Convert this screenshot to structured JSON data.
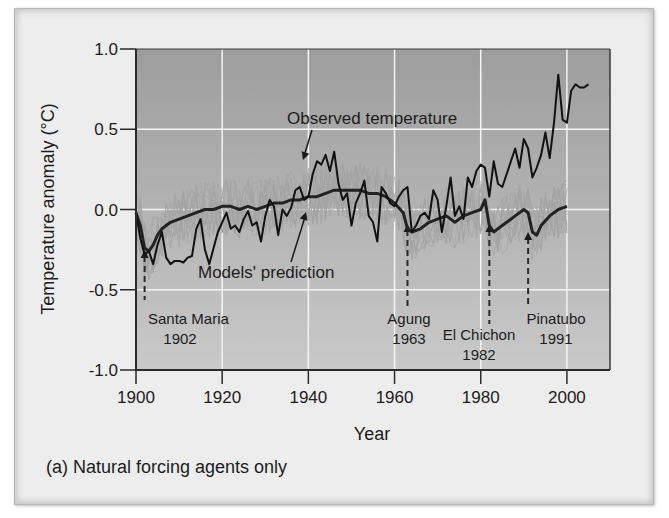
{
  "caption": "(a) Natural forcing agents only",
  "chart_data": {
    "type": "line",
    "title": "",
    "subtitle": "(a) Natural forcing agents only",
    "xlabel": "Year",
    "ylabel": "Temperature anomaly (°C)",
    "xlim": [
      1900,
      2010
    ],
    "ylim": [
      -1.0,
      1.0
    ],
    "x_ticks": [
      1900,
      1920,
      1940,
      1960,
      1980,
      2000
    ],
    "x_tick_labels": [
      "1900",
      "1920",
      "1940",
      "1960",
      "1980",
      "2000"
    ],
    "y_ticks": [
      1.0,
      0.5,
      0.0,
      -0.5,
      -1.0
    ],
    "y_tick_labels": [
      "1.0",
      "0.5",
      "0.0",
      "-0.5",
      "-1.0"
    ],
    "grid": true,
    "legend": "none (direct labels with arrows)",
    "series": [
      {
        "name": "Observed temperature",
        "color": "#111111",
        "x": [
          1900,
          1901,
          1902,
          1903,
          1904,
          1905,
          1906,
          1907,
          1908,
          1909,
          1910,
          1911,
          1912,
          1913,
          1914,
          1915,
          1916,
          1917,
          1918,
          1919,
          1920,
          1921,
          1922,
          1923,
          1924,
          1925,
          1926,
          1927,
          1928,
          1929,
          1930,
          1931,
          1932,
          1933,
          1934,
          1935,
          1936,
          1937,
          1938,
          1939,
          1940,
          1941,
          1942,
          1943,
          1944,
          1945,
          1946,
          1947,
          1948,
          1949,
          1950,
          1951,
          1952,
          1953,
          1954,
          1955,
          1956,
          1957,
          1958,
          1959,
          1960,
          1961,
          1962,
          1963,
          1964,
          1965,
          1966,
          1967,
          1968,
          1969,
          1970,
          1971,
          1972,
          1973,
          1974,
          1975,
          1976,
          1977,
          1978,
          1979,
          1980,
          1981,
          1982,
          1983,
          1984,
          1985,
          1986,
          1987,
          1988,
          1989,
          1990,
          1991,
          1992,
          1993,
          1994,
          1995,
          1996,
          1997,
          1998,
          1999,
          2000,
          2001,
          2002,
          2003,
          2004,
          2005
        ],
        "values": [
          -0.02,
          -0.18,
          -0.28,
          -0.26,
          -0.34,
          -0.22,
          -0.14,
          -0.3,
          -0.34,
          -0.32,
          -0.32,
          -0.33,
          -0.3,
          -0.29,
          -0.12,
          -0.06,
          -0.25,
          -0.34,
          -0.24,
          -0.14,
          -0.08,
          -0.02,
          -0.12,
          -0.1,
          -0.14,
          -0.06,
          -0.01,
          -0.1,
          -0.08,
          -0.2,
          -0.04,
          0.06,
          0.02,
          -0.16,
          0.0,
          -0.04,
          0.01,
          0.12,
          0.14,
          0.06,
          0.08,
          0.22,
          0.3,
          0.28,
          0.34,
          0.24,
          0.36,
          0.16,
          0.06,
          0.1,
          -0.1,
          0.04,
          0.1,
          0.18,
          -0.04,
          -0.08,
          -0.2,
          0.14,
          0.1,
          0.04,
          0.02,
          0.08,
          0.12,
          0.14,
          -0.14,
          -0.1,
          -0.04,
          -0.02,
          -0.06,
          0.12,
          0.06,
          -0.14,
          0.02,
          0.2,
          -0.04,
          0.02,
          -0.06,
          0.2,
          0.14,
          0.24,
          0.28,
          0.26,
          0.08,
          0.3,
          0.16,
          0.14,
          0.22,
          0.3,
          0.38,
          0.26,
          0.44,
          0.38,
          0.2,
          0.26,
          0.34,
          0.48,
          0.32,
          0.54,
          0.84,
          0.56,
          0.54,
          0.74,
          0.78,
          0.76,
          0.76,
          0.78
        ],
        "note": "values estimated from pixel positions"
      },
      {
        "name": "Models' prediction",
        "color": "#222222",
        "x": [
          1900,
          1901,
          1902,
          1903,
          1904,
          1905,
          1906,
          1908,
          1910,
          1912,
          1914,
          1916,
          1918,
          1920,
          1922,
          1924,
          1926,
          1928,
          1930,
          1932,
          1934,
          1936,
          1938,
          1940,
          1942,
          1944,
          1946,
          1948,
          1950,
          1952,
          1954,
          1956,
          1958,
          1960,
          1962,
          1963,
          1964,
          1966,
          1968,
          1970,
          1972,
          1974,
          1976,
          1978,
          1980,
          1981,
          1982,
          1983,
          1984,
          1986,
          1988,
          1990,
          1991,
          1992,
          1993,
          1994,
          1996,
          1998,
          2000
        ],
        "values": [
          -0.02,
          -0.1,
          -0.24,
          -0.26,
          -0.22,
          -0.16,
          -0.12,
          -0.08,
          -0.06,
          -0.04,
          -0.02,
          0.0,
          0.0,
          0.02,
          0.02,
          0.0,
          0.02,
          0.0,
          0.02,
          0.04,
          0.04,
          0.06,
          0.06,
          0.08,
          0.08,
          0.1,
          0.12,
          0.12,
          0.12,
          0.12,
          0.1,
          0.1,
          0.08,
          0.04,
          -0.02,
          -0.12,
          -0.14,
          -0.12,
          -0.08,
          -0.06,
          -0.04,
          -0.08,
          -0.04,
          -0.02,
          0.0,
          0.06,
          -0.1,
          -0.14,
          -0.12,
          -0.08,
          -0.04,
          0.0,
          -0.02,
          -0.14,
          -0.16,
          -0.1,
          -0.04,
          0.0,
          0.02
        ],
        "note": "bold model mean; values estimated from pixel positions"
      },
      {
        "name": "Individual model runs",
        "color": "#9a9a9a",
        "note": "thin gray ensemble envelope spanning roughly -0.45 to +0.3 around model mean"
      }
    ],
    "annotations": [
      {
        "text": "Observed temperature",
        "arrow_to": {
          "x": 1940,
          "y": 0.32
        }
      },
      {
        "text": "Models' prediction",
        "arrow_to": {
          "x": 1940,
          "y": 0.1
        }
      },
      {
        "text": "Santa Maria",
        "year_label": "1902",
        "event_year": 1902,
        "style": "dashed arrow"
      },
      {
        "text": "Agung",
        "year_label": "1963",
        "event_year": 1963,
        "style": "dashed arrow"
      },
      {
        "text": "El Chichon",
        "year_label": "1982",
        "event_year": 1982,
        "style": "dashed arrow"
      },
      {
        "text": "Pinatubo",
        "year_label": "1991",
        "event_year": 1991,
        "style": "dashed arrow"
      }
    ]
  },
  "labels": {
    "observed": "Observed temperature",
    "models": "Models' prediction",
    "santa_maria_name": "Santa Maria",
    "santa_maria_year": "1902",
    "agung_name": "Agung",
    "agung_year": "1963",
    "el_chichon_name": "El Chichon",
    "el_chichon_year": "1982",
    "pinatubo_name": "Pinatubo",
    "pinatubo_year": "1991"
  },
  "colors": {
    "plot_bg_top": "#9d9d9d",
    "plot_bg_bottom": "#c9c9c9",
    "grid": "#f4f4f4",
    "observed_line": "#111111",
    "model_line": "#222222",
    "ensemble": "#a3a3a3",
    "frame_bg": "#ededed"
  }
}
